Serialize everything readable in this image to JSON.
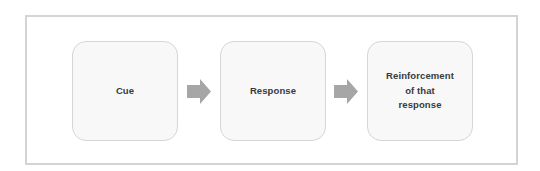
{
  "diagram": {
    "type": "flow",
    "steps": [
      {
        "id": "cue",
        "label": "Cue"
      },
      {
        "id": "response",
        "label": "Response"
      },
      {
        "id": "reinforcement",
        "label": "Reinforcement\nof that\nresponse",
        "lines": [
          "Reinforcement",
          "of that",
          "response"
        ]
      }
    ],
    "connectors": [
      {
        "from": "cue",
        "to": "response",
        "icon": "arrow-right-icon"
      },
      {
        "from": "response",
        "to": "reinforcement",
        "icon": "arrow-right-icon"
      }
    ],
    "colors": {
      "frame_border": "#d4d4d4",
      "box_fill": "#f8f8f8",
      "box_border": "#d6d6d6",
      "arrow": "#a6a6a6",
      "text": "#3a3a3a"
    }
  }
}
